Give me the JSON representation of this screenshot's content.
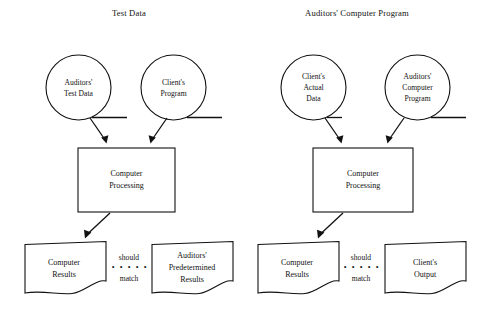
{
  "diagram": {
    "title_left": "Test Data",
    "title_right": "Auditors' Computer Program",
    "panels": [
      {
        "id": "test-data",
        "title": "Test Data",
        "inputs": [
          {
            "id": "auditors-test-data",
            "line1": "Auditors'",
            "line2": "Test Data",
            "line3": ""
          },
          {
            "id": "clients-program",
            "line1": "Client's",
            "line2": "Program",
            "line3": ""
          }
        ],
        "process": {
          "id": "computer-processing-left",
          "line1": "Computer",
          "line2": "Processing"
        },
        "outputs": [
          {
            "id": "computer-results-left",
            "line1": "Computer",
            "line2": "Results",
            "line3": ""
          },
          {
            "id": "auditors-predetermined-results",
            "line1": "Auditors'",
            "line2": "Predetermined",
            "line3": "Results"
          }
        ],
        "comparator": {
          "top": "should",
          "dots": "• • • • •",
          "bottom": "match"
        }
      },
      {
        "id": "auditors-computer-program",
        "title": "Auditors' Computer Program",
        "inputs": [
          {
            "id": "clients-actual-data",
            "line1": "Client's",
            "line2": "Actual",
            "line3": "Data"
          },
          {
            "id": "auditors-computer-program-circle",
            "line1": "Auditors'",
            "line2": "Computer",
            "line3": "Program"
          }
        ],
        "process": {
          "id": "computer-processing-right",
          "line1": "Computer",
          "line2": "Processing"
        },
        "outputs": [
          {
            "id": "computer-results-right",
            "line1": "Computer",
            "line2": "Results",
            "line3": ""
          },
          {
            "id": "clients-output",
            "line1": "Client's",
            "line2": "Output",
            "line3": ""
          }
        ],
        "comparator": {
          "top": "should",
          "dots": "• • • • •",
          "bottom": "match"
        }
      }
    ],
    "colors": {
      "stroke": "#111111",
      "background": "#ffffff"
    }
  }
}
